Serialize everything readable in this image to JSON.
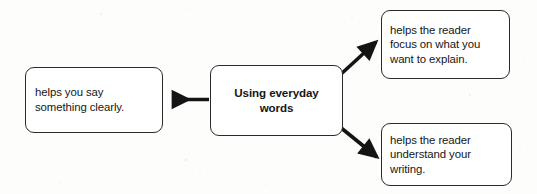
{
  "diagram": {
    "type": "idea-web",
    "title": "Using everyday words",
    "background_color": "#fdfdfc",
    "border_color": "#2b2b2b",
    "arrow_color": "#141414",
    "text_color": "#161616",
    "center": {
      "name": "center-node",
      "lines": [
        "Using everyday",
        "words"
      ]
    },
    "branches": [
      {
        "name": "left-branch",
        "direction": "left",
        "lines": [
          "helps you say",
          "something clearly."
        ]
      },
      {
        "name": "top-right-branch",
        "direction": "up-right",
        "lines": [
          "helps the reader",
          "focus on what you",
          "want to explain."
        ]
      },
      {
        "name": "bottom-right-branch",
        "direction": "down-right",
        "lines": [
          "helps the reader",
          "understand your",
          "writing."
        ]
      }
    ],
    "arrows": [
      {
        "name": "arrow-to-left",
        "from": "center-node",
        "to": "left-branch",
        "direction": "left"
      },
      {
        "name": "arrow-to-top-right",
        "from": "center-node",
        "to": "top-right-branch",
        "direction": "up-right"
      },
      {
        "name": "arrow-to-bottom-right",
        "from": "center-node",
        "to": "bottom-right-branch",
        "direction": "down-right"
      }
    ]
  }
}
